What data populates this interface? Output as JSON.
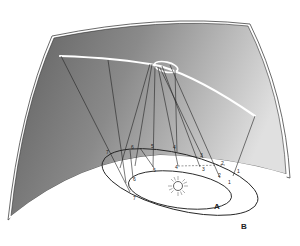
{
  "diagram": {
    "type": "retrograde-motion-illustration",
    "elements": {
      "celestial_sphere": {
        "color_dark": "#6e6e6e",
        "color_light": "#d8d8d8"
      },
      "sun": {
        "label": ""
      },
      "inner_orbit": {
        "label": "A"
      },
      "outer_orbit": {
        "label": "B"
      },
      "inner_orbit_positions": [
        "1",
        "2",
        "3",
        "4",
        "5",
        "6",
        "7"
      ],
      "outer_orbit_positions": [
        "1",
        "2",
        "3",
        "4",
        "5",
        "6",
        "7"
      ],
      "projected_path": {
        "description": "apparent path on celestial sphere with retrograde loop",
        "color": "#ffffff"
      }
    }
  }
}
